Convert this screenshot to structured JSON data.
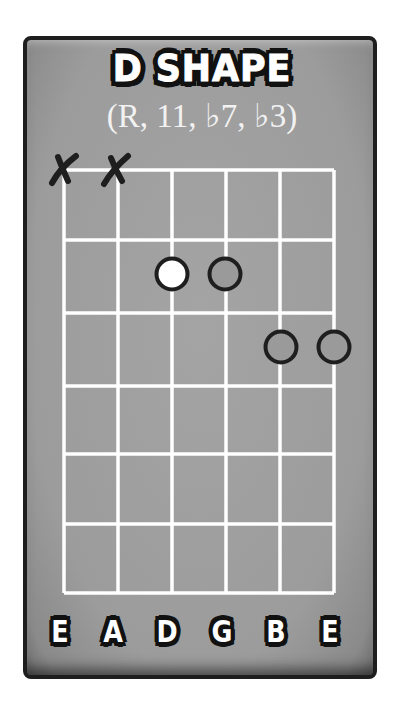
{
  "diagram": {
    "title": "D SHAPE",
    "subtitle": "(R, 11, ♭7, ♭3)",
    "colors": {
      "card_background": "#9c9c9c",
      "card_border": "#1e1e1e",
      "grid_lines": "#ffffff",
      "root_dot_fill": "#ffffff",
      "dot_outline": "#1e1e1e",
      "mute_mark": "#1e1e1e"
    },
    "strings": [
      {
        "name": "E",
        "muted": true
      },
      {
        "name": "A",
        "muted": true
      },
      {
        "name": "D",
        "muted": false
      },
      {
        "name": "G",
        "muted": false
      },
      {
        "name": "B",
        "muted": false
      },
      {
        "name": "E",
        "muted": false
      }
    ],
    "fret_rows": 6,
    "dots": [
      {
        "string": 3,
        "fret": 2,
        "role": "R",
        "filled": true
      },
      {
        "string": 4,
        "fret": 2,
        "role": "11",
        "filled": false
      },
      {
        "string": 5,
        "fret": 3,
        "role": "b7",
        "filled": false
      },
      {
        "string": 6,
        "fret": 3,
        "role": "b3",
        "filled": false
      }
    ],
    "mute_marks": [
      {
        "string": 1,
        "symbol": "X"
      },
      {
        "string": 2,
        "symbol": "X"
      }
    ]
  }
}
